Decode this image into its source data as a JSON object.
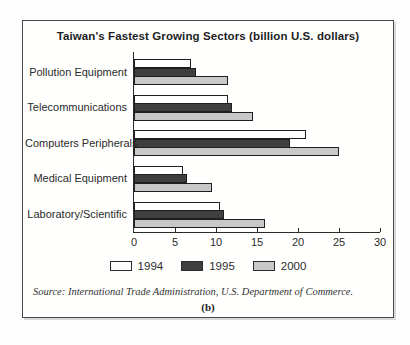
{
  "chart_data": {
    "type": "bar",
    "orientation": "horizontal",
    "title": "Taiwan's Fastest Growing Sectors (billion U.S. dollars)",
    "categories": [
      "Pollution Equipment",
      "Telecommunications",
      "Computers Peripherals",
      "Medical Equipment",
      "Laboratory/Scientific"
    ],
    "series": [
      {
        "name": "1994",
        "values": [
          7,
          11.5,
          21,
          6,
          10.5
        ],
        "color": "#ffffff"
      },
      {
        "name": "1995",
        "values": [
          7.5,
          12,
          19,
          6.5,
          11
        ],
        "color": "#3f3f3f"
      },
      {
        "name": "2000",
        "values": [
          11.5,
          14.5,
          25,
          9.5,
          16
        ],
        "color": "#c8c8c8"
      }
    ],
    "xlim": [
      0,
      30
    ],
    "xticks": [
      0,
      5,
      10,
      15,
      20,
      25,
      30
    ],
    "xlabel": "",
    "ylabel": "",
    "grid": false,
    "legend_position": "bottom",
    "bar_border_color": "#1f1f1f",
    "axis_color": "#2a2a2a",
    "source": "Source: International Trade Administration, U.S. Department of Commerce.",
    "sublabel": "(b)"
  }
}
